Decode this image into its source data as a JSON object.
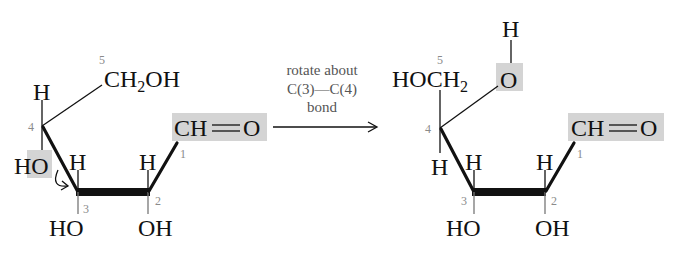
{
  "figure": {
    "highlight_color": "#d4d4d4",
    "line_color": "#111111",
    "number_color": "#8a8a8a"
  },
  "left_structure": {
    "c5_group": "CH",
    "c5_sub": "2",
    "c5_tail": "OH",
    "c4_top": "H",
    "c4_bottom": "HO",
    "c3_top": "H",
    "c3_bottom": "HO",
    "c2_top": "H",
    "c2_bottom": "OH",
    "c1_group": "CH",
    "c1_double": "O",
    "numbers": {
      "c1": "1",
      "c2": "2",
      "c3": "3",
      "c4": "4",
      "c5": "5"
    }
  },
  "arrow": {
    "line1": "rotate about",
    "line2": "C(3)—C(4)",
    "line3": "bond"
  },
  "right_structure": {
    "c5_group": "HOCH",
    "c5_sub": "2",
    "o_atom": "O",
    "o_h": "H",
    "c4_bottom": "H",
    "c3_top": "H",
    "c3_bottom": "HO",
    "c2_top": "H",
    "c2_bottom": "OH",
    "c1_group": "CH",
    "c1_double": "O",
    "numbers": {
      "c1": "1",
      "c2": "2",
      "c3": "3",
      "c4": "4",
      "c5": "5"
    }
  }
}
